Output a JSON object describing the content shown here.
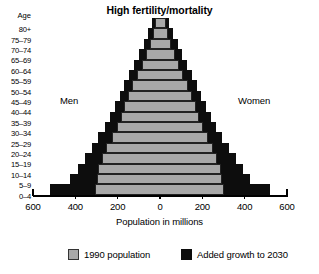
{
  "chart_data": {
    "type": "bar",
    "subtype": "population-pyramid",
    "title": "High fertility/mortality",
    "xlabel": "Population in millions",
    "ylabel": "Age",
    "xlim": [
      -600,
      600
    ],
    "xticks": [
      600,
      400,
      200,
      0,
      200,
      400,
      600
    ],
    "xtick_labels": [
      "600",
      "400",
      "200",
      "0",
      "200",
      "400",
      "600"
    ],
    "grid": false,
    "legend_position": "bottom",
    "left_side_label": "Men",
    "right_side_label": "Women",
    "categories": [
      "80+",
      "75–79",
      "70–74",
      "65–69",
      "60–64",
      "55–59",
      "50–54",
      "45–49",
      "40–44",
      "35–39",
      "30–34",
      "25–29",
      "20–24",
      "15–19",
      "10–14",
      "5–9",
      "0–4"
    ],
    "series": [
      {
        "name": "1990 population",
        "color": "#a8a8a8",
        "men": [
          22,
          33,
          48,
          66,
          86,
          108,
          131,
          152,
          170,
          186,
          205,
          228,
          253,
          276,
          292,
          300,
          305
        ],
        "women": [
          27,
          38,
          53,
          70,
          90,
          111,
          133,
          153,
          170,
          185,
          203,
          225,
          249,
          271,
          287,
          295,
          300
        ]
      },
      {
        "name": "Added growth to 2030",
        "color": "#0d0d0d",
        "men": [
          38,
          56,
          77,
          99,
          122,
          145,
          168,
          190,
          212,
          236,
          262,
          291,
          322,
          355,
          388,
          425,
          520
        ],
        "women": [
          44,
          63,
          84,
          106,
          128,
          151,
          174,
          196,
          218,
          241,
          266,
          294,
          325,
          357,
          390,
          427,
          520
        ]
      }
    ],
    "units": "millions"
  },
  "header": {
    "title": "High fertility/mortality"
  },
  "axis": {
    "age_header": "Age",
    "x_title": "Population in millions"
  },
  "labels": {
    "men": "Men",
    "women": "Women"
  },
  "legend": {
    "items": [
      {
        "label": "1990 population",
        "color": "#a8a8a8",
        "swatch": "gray-square-swatch"
      },
      {
        "label": "Added growth to 2030",
        "color": "#0d0d0d",
        "swatch": "black-square-swatch"
      }
    ]
  }
}
